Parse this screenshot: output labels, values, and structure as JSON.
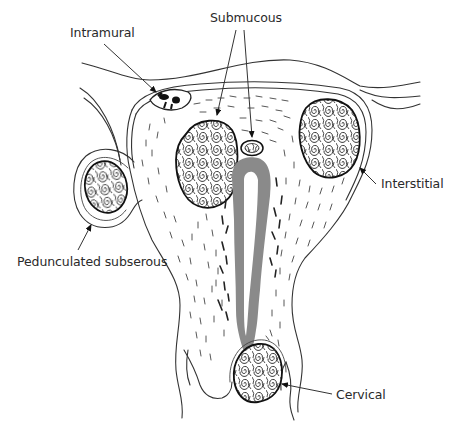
{
  "figure": {
    "type": "anatomical-illustration",
    "colors": {
      "line": "#333333",
      "cavity": "#8a8a8a",
      "background": "#ffffff",
      "fibroid_fill": "#ffffff"
    }
  },
  "labels": {
    "intramural": "Intramural",
    "submucous": "Submucous",
    "interstitial": "Interstitial",
    "pedunculated_subserous": "Pedunculated subserous",
    "cervical": "Cervical"
  }
}
